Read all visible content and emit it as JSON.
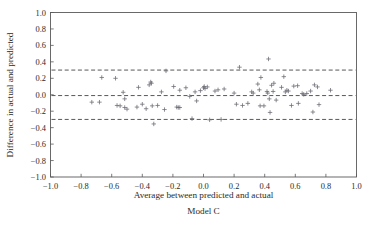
{
  "chart_data": {
    "type": "scatter",
    "title": "",
    "subtitle": "Model C",
    "xlabel": "Average between predicted and actual",
    "ylabel": "Difference in actual and predicted",
    "xlim": [
      -1.0,
      1.0
    ],
    "ylim": [
      -1.0,
      1.0
    ],
    "xticks": [
      -1.0,
      -0.8,
      -0.6,
      -0.4,
      -0.2,
      0.0,
      0.2,
      0.4,
      0.6,
      0.8,
      1.0
    ],
    "yticks": [
      -1.0,
      -0.8,
      -0.6,
      -0.4,
      -0.2,
      0.0,
      0.2,
      0.4,
      0.6,
      0.8,
      1.0
    ],
    "xtick_labels": [
      "-1.0",
      "-0.8",
      "-0.6",
      "-0.4",
      "-0.2",
      "0.0",
      "0.2",
      "0.4",
      "0.6",
      "0.8",
      "1.0"
    ],
    "ytick_labels": [
      "1.0",
      "0.8",
      "0.6",
      "0.4",
      "0.2",
      "0.0",
      "-0.2",
      "-0.4",
      "-0.6",
      "-0.8",
      "-1.0"
    ],
    "grid": false,
    "legend": "none",
    "marker_style": "plus",
    "marker_color": "#6e6e78",
    "reference_lines": [
      {
        "name": "upper-limit-of-agreement",
        "y": 0.3,
        "style": "dashed"
      },
      {
        "name": "mean-bias",
        "y": -0.01,
        "style": "dashed"
      },
      {
        "name": "lower-limit-of-agreement",
        "y": -0.3,
        "style": "dashed"
      }
    ],
    "series": [
      {
        "name": "difference-vs-average",
        "points": [
          [
            -0.73,
            -0.09
          ],
          [
            -0.68,
            -0.09
          ],
          [
            -0.665,
            0.21
          ],
          [
            -0.575,
            0.2
          ],
          [
            -0.565,
            -0.13
          ],
          [
            -0.545,
            -0.135
          ],
          [
            -0.525,
            0.03
          ],
          [
            -0.515,
            -0.05
          ],
          [
            -0.515,
            -0.155
          ],
          [
            -0.5,
            -0.175
          ],
          [
            -0.435,
            -0.15
          ],
          [
            -0.425,
            0.09
          ],
          [
            -0.4,
            -0.115
          ],
          [
            -0.375,
            -0.17
          ],
          [
            -0.355,
            0.12
          ],
          [
            -0.345,
            0.155
          ],
          [
            -0.34,
            0.14
          ],
          [
            -0.335,
            -0.135
          ],
          [
            -0.325,
            -0.355
          ],
          [
            -0.3,
            -0.13
          ],
          [
            -0.275,
            0.035
          ],
          [
            -0.255,
            -0.18
          ],
          [
            -0.245,
            0.29
          ],
          [
            -0.195,
            0.1
          ],
          [
            -0.175,
            -0.15
          ],
          [
            -0.165,
            -0.155
          ],
          [
            -0.155,
            0.055
          ],
          [
            -0.155,
            -0.155
          ],
          [
            -0.115,
            0.085
          ],
          [
            -0.09,
            -0.02
          ],
          [
            -0.075,
            -0.29
          ],
          [
            -0.055,
            0.035
          ],
          [
            -0.045,
            -0.075
          ],
          [
            -0.02,
            0.05
          ],
          [
            0.0,
            0.085
          ],
          [
            0.005,
            0.1
          ],
          [
            0.01,
            0.075
          ],
          [
            0.025,
            0.095
          ],
          [
            0.04,
            -0.305
          ],
          [
            0.075,
            0.045
          ],
          [
            0.095,
            0.06
          ],
          [
            0.115,
            -0.3
          ],
          [
            0.135,
            0.07
          ],
          [
            0.2,
            0.02
          ],
          [
            0.215,
            -0.115
          ],
          [
            0.235,
            0.335
          ],
          [
            0.255,
            -0.13
          ],
          [
            0.29,
            -0.105
          ],
          [
            0.315,
            0.035
          ],
          [
            0.325,
            0.02
          ],
          [
            0.355,
            0.13
          ],
          [
            0.365,
            0.06
          ],
          [
            0.37,
            -0.135
          ],
          [
            0.375,
            0.21
          ],
          [
            0.395,
            -0.135
          ],
          [
            0.415,
            0.04
          ],
          [
            0.42,
            0.02
          ],
          [
            0.425,
            0.435
          ],
          [
            0.43,
            -0.05
          ],
          [
            0.435,
            -0.215
          ],
          [
            0.445,
            0.115
          ],
          [
            0.455,
            0.04
          ],
          [
            0.46,
            0.14
          ],
          [
            0.475,
            -0.065
          ],
          [
            0.51,
            0.09
          ],
          [
            0.525,
            0.22
          ],
          [
            0.535,
            0.035
          ],
          [
            0.545,
            0.055
          ],
          [
            0.555,
            0.045
          ],
          [
            0.575,
            -0.13
          ],
          [
            0.59,
            0.105
          ],
          [
            0.615,
            0.11
          ],
          [
            0.62,
            -0.105
          ],
          [
            0.645,
            0.015
          ],
          [
            0.655,
            0.005
          ],
          [
            0.675,
            0.015
          ],
          [
            0.7,
            0.045
          ],
          [
            0.715,
            -0.21
          ],
          [
            0.725,
            0.12
          ],
          [
            0.745,
            0.095
          ],
          [
            0.755,
            -0.12
          ],
          [
            0.83,
            0.055
          ]
        ]
      }
    ]
  },
  "figure": {
    "xlabel": "Average between predicted and actual",
    "ylabel": "Difference in actual and predicted",
    "caption": "Model C"
  }
}
